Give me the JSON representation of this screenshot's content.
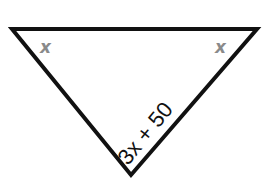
{
  "diagram": {
    "type": "triangle",
    "orientation": "inverted",
    "vertices": {
      "top_left": [
        12,
        29
      ],
      "top_right": [
        257,
        29
      ],
      "bottom": [
        131,
        175
      ]
    },
    "stroke_color": "#111111",
    "angle_labels": {
      "top_left": "x",
      "top_right": "x",
      "bottom": "3x + 50"
    },
    "angle_label_color": "#8a8a8a"
  }
}
